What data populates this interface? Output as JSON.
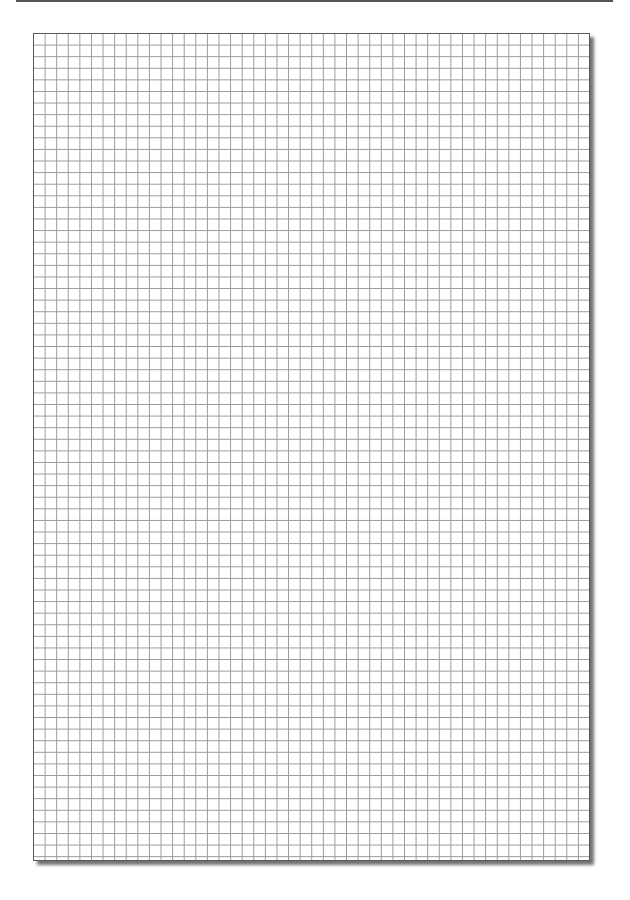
{
  "page": {
    "type": "graph-paper",
    "background": "#ffffff",
    "top_rule_color": "#555555",
    "grid": {
      "columns": 48,
      "rows": 71,
      "cell_size_px": 11.6,
      "line_color": "#9a9a9a",
      "border_color": "#5a5a5a",
      "shadow": "bottom-right drop shadow"
    }
  }
}
